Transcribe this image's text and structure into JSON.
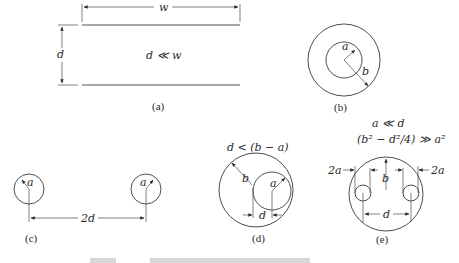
{
  "figure": {
    "panels": [
      {
        "id": "a",
        "label": "(a)",
        "description": "parallel plates",
        "symbols": {
          "width": "w",
          "separation": "d",
          "condition": "d ≪ w"
        }
      },
      {
        "id": "b",
        "label": "(b)",
        "description": "coaxial cylinders",
        "symbols": {
          "inner_radius": "a",
          "outer_radius": "b"
        }
      },
      {
        "id": "c",
        "label": "(c)",
        "description": "two parallel wires",
        "symbols": {
          "radius_left": "a",
          "radius_right": "a",
          "spacing": "2d"
        }
      },
      {
        "id": "d",
        "label": "(d)",
        "description": "eccentric cylinders",
        "symbols": {
          "outer_radius": "b",
          "inner_radius": "a",
          "offset": "d",
          "condition": "d < (b − a)"
        }
      },
      {
        "id": "e",
        "label": "(e)",
        "description": "two wires inside shield",
        "symbols": {
          "radius": "b",
          "spacing": "d",
          "wire_diam_left": "2a",
          "wire_diam_right": "2a"
        },
        "conditions": [
          "a ≪ d",
          "(b² − d²/4) ≫ a²"
        ]
      }
    ],
    "caption_visible": false
  }
}
